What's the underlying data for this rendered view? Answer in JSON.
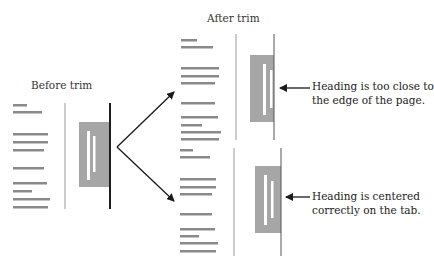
{
  "labels": {
    "before": "Before trim",
    "after": "After trim",
    "note_top_line1": "Heading is too close to",
    "note_top_line2": "the edge of the page.",
    "note_bottom_line1": "Heading is centered",
    "note_bottom_line2": "correctly on the tab."
  },
  "colors": {
    "text_lines": "#8a8a8a",
    "tab": "#a6a6a6",
    "tab_mark": "#ffffff",
    "trim_line_thin": "#9a9a9a",
    "trim_line_thick": "#1e1e1e",
    "arrow": "#1a1a1a"
  },
  "panels": {
    "before": {
      "text_rows": [
        [
          13,
          105,
          27
        ],
        [
          13,
          112,
          42
        ],
        [
          13,
          134,
          48
        ],
        [
          13,
          142,
          48
        ],
        [
          13,
          150,
          44
        ],
        [
          13,
          168,
          44
        ],
        [
          13,
          183,
          47
        ],
        [
          13,
          191,
          32
        ],
        [
          13,
          199,
          50
        ],
        [
          13,
          207,
          48
        ]
      ],
      "left_line": {
        "x": 65,
        "y1": 103,
        "y2": 209
      },
      "right_line": {
        "x": 110,
        "y1": 103,
        "y2": 209
      },
      "tab": {
        "x": 79,
        "y": 122,
        "w": 31,
        "h": 65
      },
      "marks": [
        {
          "x": 87,
          "y": 131,
          "w": 3,
          "h": 49
        },
        {
          "x": 93,
          "y": 136,
          "w": 2.5,
          "h": 36
        }
      ]
    },
    "after_top": {
      "left_line": {
        "x": 236,
        "y1": 34,
        "y2": 140
      },
      "right_line": {
        "x": 274,
        "y1": 34,
        "y2": 140
      },
      "tab": {
        "x": 250,
        "y": 55,
        "w": 24,
        "h": 67
      },
      "marks": [
        {
          "x": 263,
          "y": 64,
          "w": 3,
          "h": 51
        },
        {
          "x": 270,
          "y": 70,
          "w": 2.5,
          "h": 38
        }
      ]
    },
    "after_bottom": {
      "left_line": {
        "x": 234,
        "y1": 148,
        "y2": 256
      },
      "right_line": {
        "x": 281,
        "y1": 148,
        "y2": 256
      },
      "tab": {
        "x": 255,
        "y": 166,
        "w": 26,
        "h": 67
      },
      "marks": [
        {
          "x": 264,
          "y": 175,
          "w": 3,
          "h": 50
        },
        {
          "x": 271,
          "y": 181,
          "w": 2.5,
          "h": 37
        }
      ]
    }
  }
}
